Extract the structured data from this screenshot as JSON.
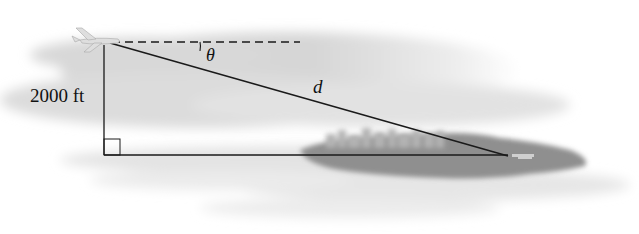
{
  "diagram": {
    "type": "right-triangle-word-problem",
    "labels": {
      "height": "2000 ft",
      "angle": "θ",
      "hypotenuse": "d"
    },
    "elements": {
      "plane": "airplane at top-left vertex",
      "horizontal_reference": "dashed horizontal line from plane",
      "vertical_leg": "altitude line from plane to ground",
      "base_leg": "horizontal ground line to island/airport",
      "hypotenuse": "line of sight from plane to airport",
      "right_angle_marker": "small square at bottom-left corner",
      "island": "gray island with city skyline and airport",
      "sky": "gray cloud band background"
    },
    "colors": {
      "line": "#1a1a1a",
      "cloud": "#d4d4d4",
      "island": "#8c8c8c",
      "city": "#b0b0b0",
      "background": "#ffffff"
    }
  }
}
